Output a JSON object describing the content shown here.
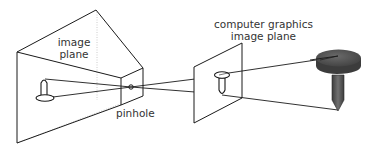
{
  "diagram": {
    "type": "pinhole-camera-model",
    "labels": {
      "image_plane_line1": "image",
      "image_plane_line2": "plane",
      "pinhole": "pinhole",
      "cg_plane_line1": "computer graphics",
      "cg_plane_line2": "image plane"
    },
    "nodes": [
      {
        "id": "image-plane",
        "label": "image plane"
      },
      {
        "id": "pinhole",
        "label": "pinhole"
      },
      {
        "id": "cg-image-plane",
        "label": "computer graphics image plane"
      },
      {
        "id": "object",
        "label": "nail"
      }
    ],
    "colors": {
      "line": "#1a1a1a",
      "nail_fill": "#5a5a5a",
      "nail_top": "#4a4a4a",
      "text": "#333333",
      "dotted": "#cccccc"
    }
  }
}
